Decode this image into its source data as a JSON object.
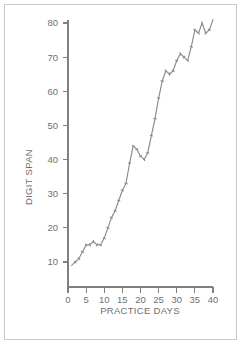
{
  "figure": {
    "background_color": "#ffffff",
    "frame_color": "#c9c9c9",
    "line_color": "#8a8a8a",
    "axis_color": "#808080",
    "text_color": "#6f6f6f"
  },
  "chart_data": {
    "type": "line",
    "title": "",
    "subtitle": "",
    "xlabel": "PRACTICE DAYS",
    "ylabel": "DIGIT SPAN",
    "xlim": [
      0,
      40
    ],
    "ylim": [
      0,
      84
    ],
    "xticks": [
      0,
      5,
      10,
      15,
      20,
      25,
      30,
      35,
      40
    ],
    "xtick_labels": [
      "0",
      "5",
      "10",
      "15",
      "20",
      "25",
      "30",
      "35",
      "40"
    ],
    "yticks": [
      10,
      20,
      30,
      40,
      50,
      60,
      70,
      80
    ],
    "ytick_labels": [
      "10",
      "20",
      "30",
      "40",
      "50",
      "60",
      "70",
      "80"
    ],
    "grid": false,
    "legend": false,
    "legend_position": "none",
    "markers": true,
    "marker_style": "tick",
    "x": [
      1,
      2,
      3,
      4,
      5,
      6,
      7,
      8,
      9,
      10,
      11,
      12,
      13,
      14,
      15,
      16,
      17,
      18,
      19,
      20,
      21,
      22,
      23,
      24,
      25,
      26,
      27,
      28,
      29,
      30,
      31,
      32,
      33,
      34,
      35,
      36,
      37,
      38,
      39,
      40
    ],
    "series": [
      {
        "name": "digit span",
        "values": [
          9,
          10,
          11,
          13,
          15,
          15,
          16,
          15,
          15,
          17,
          20,
          23,
          25,
          28,
          31,
          33,
          39,
          44,
          43,
          41,
          40,
          42,
          47,
          52,
          58,
          63,
          66,
          65,
          66,
          69,
          71,
          70,
          69,
          73,
          78,
          77,
          80,
          77,
          78,
          81
        ]
      }
    ],
    "annotations": []
  },
  "axis_titles": {
    "x": "PRACTICE DAYS",
    "y": "DIGIT SPAN"
  }
}
